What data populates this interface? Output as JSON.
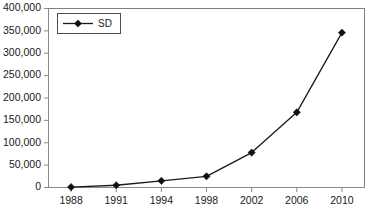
{
  "chart_data": {
    "type": "line",
    "title": "",
    "xlabel": "",
    "ylabel": "",
    "grid": false,
    "legend_position": "top-left",
    "categories": [
      "1988",
      "1991",
      "1994",
      "1998",
      "2002",
      "2006",
      "2010"
    ],
    "x": [
      1988,
      1991,
      1994,
      1998,
      2002,
      2006,
      2010
    ],
    "ylim": [
      0,
      400000
    ],
    "ytick_labels": [
      "0",
      "50,000",
      "100,000",
      "150,000",
      "200,000",
      "250,000",
      "300,000",
      "350,000",
      "400,000"
    ],
    "ytick_values": [
      0,
      50000,
      100000,
      150000,
      200000,
      250000,
      300000,
      350000,
      400000
    ],
    "series": [
      {
        "name": "SD",
        "marker": "diamond",
        "color": "#111111",
        "values": [
          1000,
          5000,
          15000,
          25000,
          78000,
          168000,
          346000
        ]
      }
    ]
  },
  "legend": {
    "entries": [
      {
        "label": "SD",
        "marker": "diamond-marker-icon"
      }
    ]
  }
}
